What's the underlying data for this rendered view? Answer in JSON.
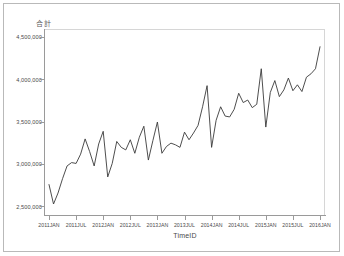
{
  "chart_data": {
    "type": "line",
    "title": "",
    "ylabel": "合計",
    "xlabel": "TimeID",
    "ylim": [
      2400000,
      4600000
    ],
    "y_ticks": [
      2500000,
      3000000,
      3500000,
      4000000,
      4500000
    ],
    "y_tick_labels": [
      "2,500,000",
      "3,000,000",
      "3,500,000",
      "4,000,000",
      "4,500,000"
    ],
    "x_tick_labels": [
      "2011JAN",
      "2011JUL",
      "2012JAN",
      "2012JUL",
      "2013JAN",
      "2013JUL",
      "2014JAN",
      "2014JUL",
      "2015JAN",
      "2015JUL",
      "2016JAN"
    ],
    "grid": false,
    "legend": null,
    "line_color": "#3a3a3a",
    "series": [
      {
        "name": "合計",
        "x": [
          "2011JAN",
          "2011FEB",
          "2011MAR",
          "2011APR",
          "2011MAY",
          "2011JUN",
          "2011JUL",
          "2011AUG",
          "2011SEP",
          "2011OCT",
          "2011NOV",
          "2011DEC",
          "2012JAN",
          "2012FEB",
          "2012MAR",
          "2012APR",
          "2012MAY",
          "2012JUN",
          "2012JUL",
          "2012AUG",
          "2012SEP",
          "2012OCT",
          "2012NOV",
          "2012DEC",
          "2013JAN",
          "2013FEB",
          "2013MAR",
          "2013APR",
          "2013MAY",
          "2013JUN",
          "2013JUL",
          "2013AUG",
          "2013SEP",
          "2013OCT",
          "2013NOV",
          "2013DEC",
          "2014JAN",
          "2014FEB",
          "2014MAR",
          "2014APR",
          "2014MAY",
          "2014JUN",
          "2014JUL",
          "2014AUG",
          "2014SEP",
          "2014OCT",
          "2014NOV",
          "2014DEC",
          "2015JAN",
          "2015FEB",
          "2015MAR",
          "2015APR",
          "2015MAY",
          "2015JUN",
          "2015JUL",
          "2015AUG",
          "2015SEP",
          "2015OCT",
          "2015NOV",
          "2015DEC",
          "2016JAN"
        ],
        "values": [
          2760000,
          2530000,
          2660000,
          2830000,
          2980000,
          3020000,
          3010000,
          3120000,
          3300000,
          3150000,
          2980000,
          3240000,
          3390000,
          2850000,
          3010000,
          3270000,
          3200000,
          3170000,
          3290000,
          3130000,
          3320000,
          3450000,
          3050000,
          3280000,
          3500000,
          3130000,
          3210000,
          3250000,
          3230000,
          3200000,
          3380000,
          3290000,
          3370000,
          3460000,
          3680000,
          3930000,
          3200000,
          3520000,
          3680000,
          3570000,
          3560000,
          3650000,
          3840000,
          3730000,
          3760000,
          3670000,
          3710000,
          4130000,
          3440000,
          3850000,
          3990000,
          3800000,
          3880000,
          4020000,
          3870000,
          3940000,
          3860000,
          4030000,
          4070000,
          4130000,
          4390000
        ]
      }
    ]
  }
}
